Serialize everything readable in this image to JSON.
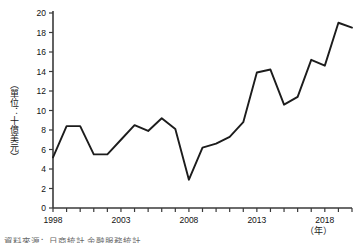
{
  "chart_data": {
    "type": "line",
    "title": "",
    "xlabel": "（年）",
    "ylabel": "（單位：十億美元）",
    "xlim": [
      1998,
      2020
    ],
    "ylim": [
      0,
      20
    ],
    "ytick_step": 2,
    "yticks": [
      0,
      2,
      4,
      6,
      8,
      10,
      12,
      14,
      16,
      18,
      20
    ],
    "xticks_labeled": [
      "1998",
      "2003",
      "2008",
      "2013",
      "2018"
    ],
    "xtick_every_year": true,
    "grid": false,
    "legend": false,
    "line_color": "#1c1c1c",
    "x": [
      1998,
      1999,
      2000,
      2001,
      2002,
      2003,
      2004,
      2005,
      2006,
      2007,
      2008,
      2009,
      2010,
      2011,
      2012,
      2013,
      2014,
      2015,
      2016,
      2017,
      2018,
      2019,
      2020
    ],
    "values": [
      5.2,
      8.4,
      8.4,
      5.5,
      5.5,
      7.0,
      8.5,
      7.9,
      9.2,
      8.1,
      2.9,
      6.2,
      6.6,
      7.3,
      8.8,
      13.9,
      14.2,
      10.6,
      11.4,
      15.2,
      14.6,
      19.0,
      18.5
    ],
    "series": [
      {
        "name": "",
        "values": [
          5.2,
          8.4,
          8.4,
          5.5,
          5.5,
          7.0,
          8.5,
          7.9,
          9.2,
          8.1,
          2.9,
          6.2,
          6.6,
          7.3,
          8.8,
          13.9,
          14.2,
          10.6,
          11.4,
          15.2,
          14.6,
          19.0,
          18.5
        ]
      }
    ]
  },
  "axis": {
    "y_caption": "（單位：十億美元）",
    "x_caption": "（年）"
  },
  "footer": {
    "source_note": "資料來源：日商統計 金融服務統計"
  }
}
